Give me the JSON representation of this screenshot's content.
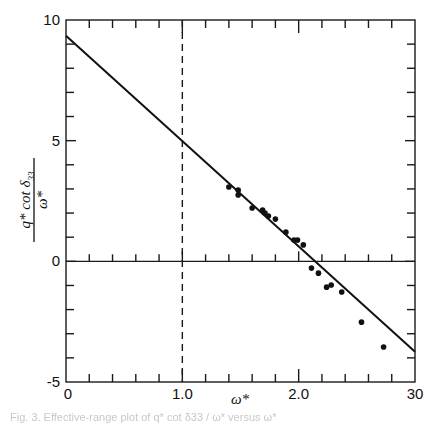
{
  "chart_data": {
    "type": "scatter",
    "title": "",
    "xlabel": "ω*",
    "ylabel": "q* cot δ33 / ω*",
    "ylabel_parts": {
      "numerator": "q* cot δ",
      "subscript": "33",
      "denominator": "ω*"
    },
    "xlim": [
      0,
      3.0
    ],
    "ylim": [
      -5,
      10
    ],
    "x_ticks": [
      {
        "value": 0,
        "label": "0"
      },
      {
        "value": 1.0,
        "label": "1.0"
      },
      {
        "value": 2.0,
        "label": "2.0"
      },
      {
        "value": 3.0,
        "label": "30"
      }
    ],
    "x_minor_tick_step": 0.2,
    "y_ticks": [
      {
        "value": 10,
        "label": "10"
      },
      {
        "value": 5,
        "label": "5"
      },
      {
        "value": 0,
        "label": "0"
      },
      {
        "value": -5,
        "label": "-5"
      }
    ],
    "y_minor_tick_step": 1,
    "grid": false,
    "legend": null,
    "reference_lines": [
      {
        "orientation": "vertical",
        "x": 1.0,
        "style": "dashed"
      },
      {
        "orientation": "horizontal",
        "y": 0,
        "style": "solid"
      }
    ],
    "fit_line": {
      "x": [
        0,
        3.0
      ],
      "y": [
        9.35,
        -3.75
      ],
      "intercept": 9.35,
      "slope": -4.37
    },
    "series": [
      {
        "name": "data",
        "marker": "filled-circle",
        "x": [
          1.4,
          1.48,
          1.48,
          1.6,
          1.69,
          1.71,
          1.74,
          1.8,
          1.89,
          1.96,
          1.99,
          2.04,
          2.11,
          2.17,
          2.24,
          2.28,
          2.37,
          2.54,
          2.73
        ],
        "y": [
          3.08,
          2.95,
          2.75,
          2.21,
          2.13,
          2.0,
          1.88,
          1.75,
          1.21,
          0.88,
          0.88,
          0.68,
          -0.28,
          -0.49,
          -1.07,
          -0.98,
          -1.27,
          -2.52,
          -3.55
        ]
      }
    ]
  },
  "caption": "Fig. 3. Effective-range plot of q* cot δ33 / ω* versus ω*"
}
